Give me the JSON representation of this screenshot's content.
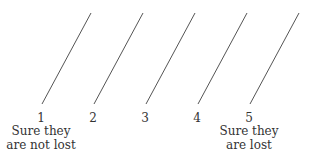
{
  "scale": {
    "points": [
      {
        "value": "1",
        "caption_line1": "Sure they",
        "caption_line2": "are not lost"
      },
      {
        "value": "2",
        "caption_line1": "",
        "caption_line2": ""
      },
      {
        "value": "3",
        "caption_line1": "",
        "caption_line2": ""
      },
      {
        "value": "4",
        "caption_line1": "",
        "caption_line2": ""
      },
      {
        "value": "5",
        "caption_line1": "Sure they",
        "caption_line2": "are lost"
      }
    ]
  },
  "colors": {
    "line": "#555555",
    "text": "#333333",
    "background": "#ffffff"
  }
}
